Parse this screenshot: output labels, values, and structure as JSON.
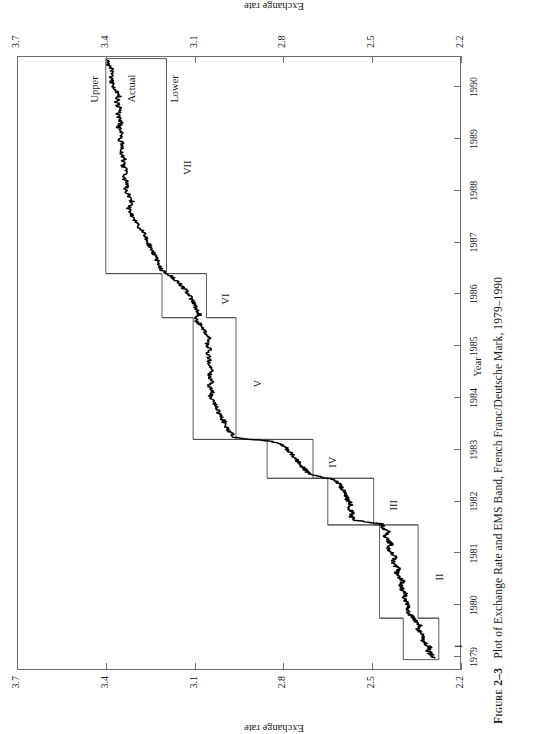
{
  "caption": {
    "figure_number": "Figure 2–3",
    "text": "Plot of Exchange Rate and EMS Band, French Franc/Deutsche Mark, 1979–1990"
  },
  "axes": {
    "ylabel_left": "Exchange rate",
    "ylabel_right": "Exchange rate",
    "xlabel": "Year"
  },
  "annotations": {
    "upper": "Upper",
    "actual": "Actual",
    "lower": "Lower"
  },
  "regions": [
    "I",
    "II",
    "III",
    "IV",
    "V",
    "VI",
    "VII"
  ],
  "colors": {
    "axis": "#6d6d6d",
    "band": "#4a4a4a",
    "series": "#000000",
    "paper": "#ffffff"
  },
  "chart_data": {
    "type": "line",
    "title": "Plot of Exchange Rate and EMS Band, French Franc/Deutsche Mark, 1979–1990",
    "xlabel": "Year",
    "ylabel": "Exchange rate",
    "xlim": [
      1978.75,
      1990.6
    ],
    "ylim": [
      2.2,
      3.7
    ],
    "xticks": [
      1979,
      1980,
      1981,
      1982,
      1983,
      1984,
      1985,
      1986,
      1987,
      1988,
      1989,
      1990
    ],
    "yticks": [
      2.2,
      2.5,
      2.8,
      3.1,
      3.4,
      3.7
    ],
    "grid": false,
    "legend": "in-plot labels: Upper, Actual, Lower",
    "bands": [
      {
        "region": "I",
        "start": 1978.95,
        "end": 1979.75,
        "lower": 2.275,
        "upper": 2.395
      },
      {
        "region": "II",
        "start": 1979.75,
        "end": 1981.55,
        "lower": 2.345,
        "upper": 2.475
      },
      {
        "region": "III",
        "start": 1981.55,
        "end": 1982.45,
        "lower": 2.495,
        "upper": 2.65
      },
      {
        "region": "IV",
        "start": 1982.45,
        "end": 1983.2,
        "lower": 2.7,
        "upper": 2.855
      },
      {
        "region": "V",
        "start": 1983.2,
        "end": 1985.55,
        "lower": 2.96,
        "upper": 3.105
      },
      {
        "region": "VI",
        "start": 1985.55,
        "end": 1986.4,
        "lower": 3.06,
        "upper": 3.21
      },
      {
        "region": "VII",
        "start": 1986.4,
        "end": 1990.55,
        "lower": 3.195,
        "upper": 3.4
      }
    ],
    "series": [
      {
        "name": "Actual",
        "x": [
          1978.98,
          1979.05,
          1979.12,
          1979.19,
          1979.26,
          1979.33,
          1979.4,
          1979.47,
          1979.54,
          1979.61,
          1979.68,
          1979.75,
          1979.82,
          1979.9,
          1979.98,
          1980.06,
          1980.14,
          1980.22,
          1980.3,
          1980.38,
          1980.46,
          1980.54,
          1980.62,
          1980.7,
          1980.78,
          1980.86,
          1980.94,
          1981.02,
          1981.1,
          1981.18,
          1981.26,
          1981.34,
          1981.42,
          1981.5,
          1981.57,
          1981.64,
          1981.72,
          1981.8,
          1981.88,
          1981.96,
          1982.04,
          1982.12,
          1982.2,
          1982.28,
          1982.36,
          1982.44,
          1982.52,
          1982.6,
          1982.68,
          1982.76,
          1982.84,
          1982.92,
          1983.0,
          1983.08,
          1983.16,
          1983.24,
          1983.34,
          1983.44,
          1983.54,
          1983.64,
          1983.74,
          1983.84,
          1983.94,
          1984.04,
          1984.14,
          1984.24,
          1984.34,
          1984.44,
          1984.54,
          1984.64,
          1984.74,
          1984.84,
          1984.94,
          1985.04,
          1985.14,
          1985.24,
          1985.34,
          1985.44,
          1985.52,
          1985.6,
          1985.7,
          1985.8,
          1985.9,
          1986.0,
          1986.1,
          1986.2,
          1986.3,
          1986.38,
          1986.46,
          1986.58,
          1986.7,
          1986.82,
          1986.94,
          1987.06,
          1987.18,
          1987.3,
          1987.42,
          1987.54,
          1987.66,
          1987.78,
          1987.9,
          1988.02,
          1988.14,
          1988.26,
          1988.38,
          1988.5,
          1988.62,
          1988.74,
          1988.86,
          1988.98,
          1989.1,
          1989.22,
          1989.34,
          1989.46,
          1989.58,
          1989.7,
          1989.82,
          1989.94,
          1990.06,
          1990.18,
          1990.3,
          1990.42,
          1990.52
        ],
        "y": [
          2.29,
          2.3,
          2.312,
          2.305,
          2.322,
          2.33,
          2.326,
          2.338,
          2.345,
          2.34,
          2.352,
          2.36,
          2.372,
          2.38,
          2.374,
          2.386,
          2.392,
          2.386,
          2.398,
          2.404,
          2.396,
          2.41,
          2.418,
          2.412,
          2.424,
          2.43,
          2.422,
          2.436,
          2.444,
          2.436,
          2.45,
          2.456,
          2.448,
          2.462,
          2.47,
          2.56,
          2.572,
          2.566,
          2.578,
          2.57,
          2.584,
          2.59,
          2.596,
          2.604,
          2.614,
          2.64,
          2.712,
          2.724,
          2.736,
          2.748,
          2.76,
          2.772,
          2.786,
          2.8,
          2.84,
          2.968,
          2.98,
          2.992,
          3.0,
          3.012,
          3.02,
          3.03,
          3.038,
          3.046,
          3.04,
          3.05,
          3.042,
          3.052,
          3.044,
          3.054,
          3.048,
          3.058,
          3.05,
          3.06,
          3.052,
          3.062,
          3.07,
          3.085,
          3.098,
          3.082,
          3.092,
          3.1,
          3.11,
          3.12,
          3.134,
          3.15,
          3.168,
          3.188,
          3.21,
          3.222,
          3.232,
          3.24,
          3.252,
          3.262,
          3.272,
          3.286,
          3.3,
          3.312,
          3.322,
          3.31,
          3.322,
          3.334,
          3.326,
          3.34,
          3.332,
          3.344,
          3.336,
          3.348,
          3.34,
          3.352,
          3.344,
          3.356,
          3.348,
          3.36,
          3.352,
          3.364,
          3.356,
          3.368,
          3.376,
          3.384,
          3.378,
          3.388,
          3.396
        ]
      }
    ]
  }
}
